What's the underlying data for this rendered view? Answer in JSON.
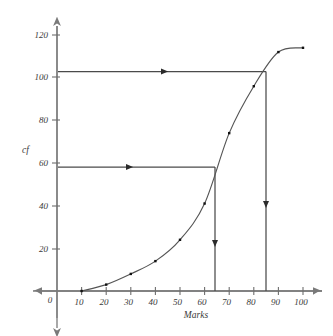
{
  "chart_data": {
    "type": "line",
    "title": "",
    "subtitle": "",
    "xlabel": "Marks",
    "ylabel": "cf",
    "xlim": [
      0,
      100
    ],
    "ylim": [
      0,
      120
    ],
    "xticks": [
      0,
      10,
      20,
      30,
      40,
      50,
      60,
      70,
      80,
      90,
      100
    ],
    "xtick_labels": [
      "0",
      "10",
      "20",
      "30",
      "40",
      "50",
      "60",
      "70",
      "80",
      "90",
      "100"
    ],
    "yticks": [
      0,
      20,
      40,
      60,
      80,
      100,
      120
    ],
    "ytick_labels": [
      "0",
      "20",
      "40",
      "60",
      "80",
      "100",
      "120"
    ],
    "grid": false,
    "legend": null,
    "axis_style": "double-headed-arrow",
    "series": [
      {
        "name": "cumulative frequency",
        "marker": "square",
        "x": [
          10,
          20,
          30,
          40,
          50,
          60,
          70,
          80,
          90,
          100
        ],
        "values": [
          0,
          3,
          8,
          14,
          24,
          41,
          74,
          96,
          112,
          114
        ]
      }
    ],
    "annotations": [
      {
        "name": "upper-percentile-construction",
        "cf": 103,
        "marks": 85,
        "horizontal_from_x": 0,
        "horizontal_to_x": 85,
        "horizontal_arrow": "right",
        "vertical_from_cf": 103,
        "vertical_to_cf": 0,
        "vertical_arrow": "down"
      },
      {
        "name": "median-construction",
        "cf": 58,
        "marks": 66,
        "horizontal_from_x": 0,
        "horizontal_to_x": 66,
        "horizontal_arrow": "right",
        "vertical_from_cf": 58,
        "vertical_to_cf": 0,
        "vertical_arrow": "down"
      }
    ],
    "colors": {
      "axis": "#7a7a7a",
      "curve": "#555555",
      "marker": "#111111",
      "construction": "#4a4a4a",
      "text": "#3a3a3a",
      "background": "#ffffff"
    }
  },
  "axes": {
    "x_title": "Marks",
    "y_title": "cf",
    "x_tick_labels": [
      "0",
      "10",
      "20",
      "30",
      "40",
      "50",
      "60",
      "70",
      "80",
      "90",
      "100"
    ],
    "y_tick_labels": [
      "20",
      "40",
      "60",
      "80",
      "100",
      "120"
    ]
  }
}
